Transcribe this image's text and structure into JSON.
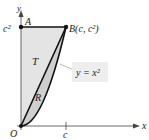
{
  "diagram": {
    "axes": {
      "x_label": "x",
      "y_label": "y",
      "origin_label": "O",
      "x_tick_label": "c",
      "y_tick_label": "c²"
    },
    "points": {
      "A": "A",
      "B": "B(c, c²)"
    },
    "regions": {
      "T": "T",
      "R": "R"
    },
    "curve_label": "y = x²",
    "colors": {
      "region_T": "#e4e4e4",
      "region_R": "#cfcfcf",
      "curve": "#111111",
      "label_box": "#eeeeee"
    }
  }
}
